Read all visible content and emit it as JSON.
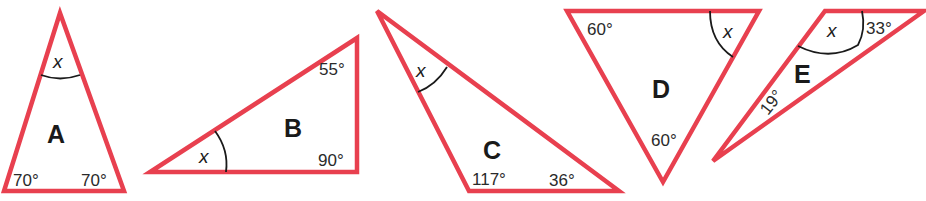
{
  "stroke_color": "#e8404f",
  "triangles": [
    {
      "label": "A",
      "unknown": "x",
      "angles": [
        "70°",
        "70°"
      ]
    },
    {
      "label": "B",
      "unknown": "x",
      "angles": [
        "55°",
        "90°"
      ]
    },
    {
      "label": "C",
      "unknown": "x",
      "angles": [
        "117°",
        "36°"
      ]
    },
    {
      "label": "D",
      "unknown": "x",
      "angles": [
        "60°",
        "60°"
      ]
    },
    {
      "label": "E",
      "unknown": "x",
      "angles": [
        "33°",
        "19°"
      ]
    }
  ]
}
